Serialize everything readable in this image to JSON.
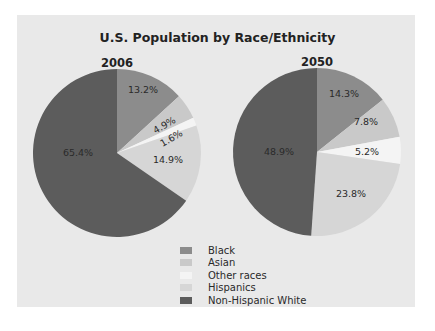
{
  "chart_data": {
    "type": "pie",
    "title": "U.S. Population by Race/Ethnicity",
    "legend": {
      "position": "bottom-center",
      "entries": [
        {
          "label": "Black",
          "color": "#8c8c8c"
        },
        {
          "label": "Asian",
          "color": "#c9c9c9"
        },
        {
          "label": "Other races",
          "color": "#f4f4f4"
        },
        {
          "label": "Hispanics",
          "color": "#d6d6d6"
        },
        {
          "label": "Non-Hispanic White",
          "color": "#5c5c5c"
        }
      ]
    },
    "charts": [
      {
        "subtitle": "2006",
        "categories": [
          "Black",
          "Asian",
          "Other races",
          "Hispanics",
          "Non-Hispanic White"
        ],
        "values": [
          13.2,
          4.9,
          1.6,
          14.9,
          65.4
        ],
        "labels": [
          "13.2%",
          "4.9%",
          "1.6%",
          "14.9%",
          "65.4%"
        ]
      },
      {
        "subtitle": "2050",
        "categories": [
          "Black",
          "Asian",
          "Other races",
          "Hispanics",
          "Non-Hispanic White"
        ],
        "values": [
          14.3,
          7.8,
          5.2,
          23.8,
          48.9
        ],
        "labels": [
          "14.3%",
          "7.8%",
          "5.2%",
          "23.8%",
          "48.9%"
        ]
      }
    ]
  }
}
